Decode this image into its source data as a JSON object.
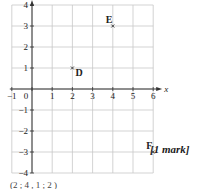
{
  "chart_data": {
    "type": "scatter",
    "title": "",
    "xlabel": "x",
    "ylabel": "y",
    "xlim": [
      -1,
      6
    ],
    "ylim": [
      -4,
      4
    ],
    "grid": true,
    "x_ticks": [
      -1,
      0,
      1,
      2,
      3,
      4,
      5,
      6
    ],
    "y_ticks": [
      -4,
      -3,
      -2,
      -1,
      1,
      2,
      3,
      4
    ],
    "points": [
      {
        "label": "D",
        "x": 2,
        "y": 1
      },
      {
        "label": "E",
        "x": 4,
        "y": 3
      },
      {
        "label": "F",
        "x": 6,
        "y": -3
      }
    ]
  },
  "mark_label": "[1 mark]",
  "footer_text": "(2 ; 4 , 1 ; 2 )",
  "colors": {
    "grid": "#c8c8c8",
    "axis": "#333333",
    "text": "#222222"
  }
}
